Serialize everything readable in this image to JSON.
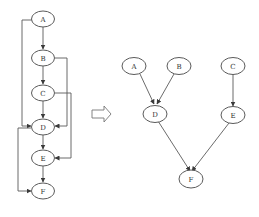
{
  "diagram": {
    "left_graph": {
      "description": "Linear chain with skip edges",
      "nodes": [
        {
          "id": "A",
          "label": "A"
        },
        {
          "id": "B",
          "label": "B"
        },
        {
          "id": "C",
          "label": "C"
        },
        {
          "id": "D",
          "label": "D"
        },
        {
          "id": "E",
          "label": "E"
        },
        {
          "id": "F",
          "label": "F"
        }
      ],
      "edges": [
        {
          "from": "A",
          "to": "B"
        },
        {
          "from": "B",
          "to": "C"
        },
        {
          "from": "C",
          "to": "D"
        },
        {
          "from": "D",
          "to": "E"
        },
        {
          "from": "E",
          "to": "F"
        },
        {
          "from": "A",
          "to": "D",
          "route": "left"
        },
        {
          "from": "B",
          "to": "D",
          "route": "right"
        },
        {
          "from": "C",
          "to": "E",
          "route": "right"
        },
        {
          "from": "D",
          "to": "F",
          "route": "left"
        }
      ]
    },
    "transform_arrow": {
      "direction": "right",
      "meaning": "transforms-into"
    },
    "right_graph": {
      "description": "Reduced dependency graph",
      "nodes": [
        {
          "id": "A",
          "label": "A"
        },
        {
          "id": "B",
          "label": "B"
        },
        {
          "id": "C",
          "label": "C"
        },
        {
          "id": "D",
          "label": "D"
        },
        {
          "id": "E",
          "label": "E"
        },
        {
          "id": "F",
          "label": "F"
        }
      ],
      "edges": [
        {
          "from": "A",
          "to": "D"
        },
        {
          "from": "B",
          "to": "D"
        },
        {
          "from": "C",
          "to": "E"
        },
        {
          "from": "D",
          "to": "F"
        },
        {
          "from": "E",
          "to": "F"
        }
      ]
    },
    "colors": {
      "stroke": "#5a5a5a",
      "text": "#333333",
      "background": "#ffffff"
    }
  }
}
